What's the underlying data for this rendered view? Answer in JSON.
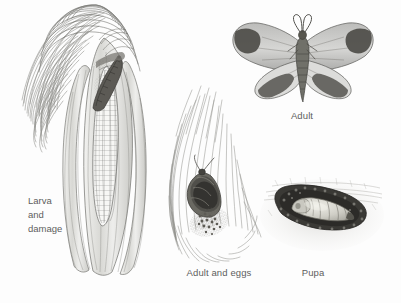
{
  "plate": {
    "title": "Corn earworm life cycle illustration plate",
    "background_color": "#fdfdfd",
    "ink_color": "#4a4a4a",
    "label_color": "#5e5e5e",
    "medium": "pencil-drawing"
  },
  "figures": [
    {
      "id": "larva-and-damage",
      "icon": "corn-ear-with-larva-icon",
      "caption_lines": [
        "Larva",
        "and",
        "damage"
      ],
      "caption_full": "Larva and damage",
      "caption_x": 28,
      "caption_y": 195,
      "align": "left"
    },
    {
      "id": "adult",
      "icon": "moth-spread-wings-icon",
      "caption_lines": [
        "Adult"
      ],
      "caption_full": "Adult",
      "caption_x": 302,
      "caption_y": 119,
      "align": "center"
    },
    {
      "id": "adult-and-eggs",
      "icon": "moth-on-silk-with-eggs-icon",
      "caption_lines": [
        "Adult and eggs"
      ],
      "caption_full": "Adult and eggs",
      "caption_x": 219,
      "caption_y": 268,
      "align": "center"
    },
    {
      "id": "pupa",
      "icon": "pupa-in-soil-cell-icon",
      "caption_lines": [
        "Pupa"
      ],
      "caption_full": "Pupa",
      "caption_x": 313,
      "caption_y": 268,
      "align": "center"
    }
  ]
}
